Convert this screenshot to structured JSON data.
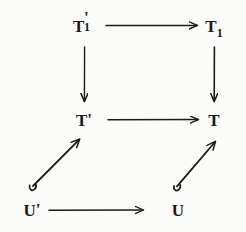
{
  "figure": {
    "kind": "commutative-diagram",
    "background_color": "#fbfbf9",
    "ink_color": "#1a1a18",
    "width": 246,
    "height": 232
  },
  "nodes": [
    {
      "id": "t1-prime",
      "label": "T'₁",
      "base": "T",
      "prime": "'",
      "subscript": "1",
      "x": 84,
      "y": 26,
      "row": "top",
      "column": "left"
    },
    {
      "id": "t1",
      "label": "T₁",
      "base": "T",
      "prime": "",
      "subscript": "1",
      "x": 214,
      "y": 26,
      "row": "top",
      "column": "right"
    },
    {
      "id": "t-prime",
      "label": "T'",
      "base": "T",
      "prime": "'",
      "subscript": "",
      "x": 84,
      "y": 120,
      "row": "middle",
      "column": "left"
    },
    {
      "id": "t",
      "label": "T",
      "base": "T",
      "prime": "",
      "subscript": "",
      "x": 214,
      "y": 120,
      "row": "middle",
      "column": "right"
    },
    {
      "id": "u-prime",
      "label": "U'",
      "base": "U",
      "prime": "'",
      "subscript": "",
      "x": 32,
      "y": 210,
      "row": "bottom",
      "column": "left"
    },
    {
      "id": "u",
      "label": "U",
      "base": "U",
      "prime": "",
      "subscript": "",
      "x": 178,
      "y": 210,
      "row": "bottom",
      "column": "right"
    }
  ],
  "arrows": [
    {
      "id": "arrow-t1prime-to-t1",
      "from": "t1-prime",
      "to": "t1",
      "direction": "right",
      "style": "straight",
      "label": ""
    },
    {
      "id": "arrow-t1prime-to-tprime",
      "from": "t1-prime",
      "to": "t-prime",
      "direction": "down",
      "style": "straight",
      "label": ""
    },
    {
      "id": "arrow-t1-to-t",
      "from": "t1",
      "to": "t",
      "direction": "down",
      "style": "straight",
      "label": ""
    },
    {
      "id": "arrow-tprime-to-t",
      "from": "t-prime",
      "to": "t",
      "direction": "right",
      "style": "straight",
      "label": ""
    },
    {
      "id": "arrow-uprime-to-tprime",
      "from": "u-prime",
      "to": "t-prime",
      "direction": "up-right",
      "style": "hooked-diagonal",
      "label": ""
    },
    {
      "id": "arrow-u-to-t",
      "from": "u",
      "to": "t",
      "direction": "up-right",
      "style": "hooked-diagonal",
      "label": ""
    },
    {
      "id": "arrow-uprime-to-u",
      "from": "u-prime",
      "to": "u",
      "direction": "right",
      "style": "straight",
      "label": ""
    }
  ]
}
